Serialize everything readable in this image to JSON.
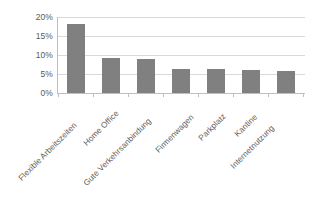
{
  "chart_data": {
    "type": "bar",
    "title": "",
    "subtitle": "",
    "xlabel": "",
    "ylabel": "",
    "categories": [
      "Flexible Arbeitszeiten",
      "Home Office",
      "Gute Verkehrsanbindung",
      "Firmenwagen",
      "Parkplatz",
      "Kantine",
      "Internetnutzung"
    ],
    "values": [
      18.2,
      9.2,
      9.0,
      6.4,
      6.3,
      6.0,
      5.8
    ],
    "value_suffix": "%",
    "ylim": [
      0,
      20
    ],
    "ytick_values": [
      0,
      5,
      10,
      15,
      20
    ],
    "ytick_labels": [
      "0%",
      "5%",
      "10%",
      "15%",
      "20%"
    ],
    "grid": true,
    "grid_axis": "y",
    "legend": false,
    "legend_position": "none",
    "series": [
      {
        "name": "Anteil",
        "values": [
          18.2,
          9.2,
          9.0,
          6.4,
          6.3,
          6.0,
          5.8
        ]
      }
    ],
    "colors": {
      "bar_fill": "#808080",
      "gridline": "#d9d9d9",
      "axis_line": "#bfbfbf",
      "tick_text": "#5a5a5a",
      "category_text": "#5e5e5e",
      "background": "#ffffff"
    }
  }
}
